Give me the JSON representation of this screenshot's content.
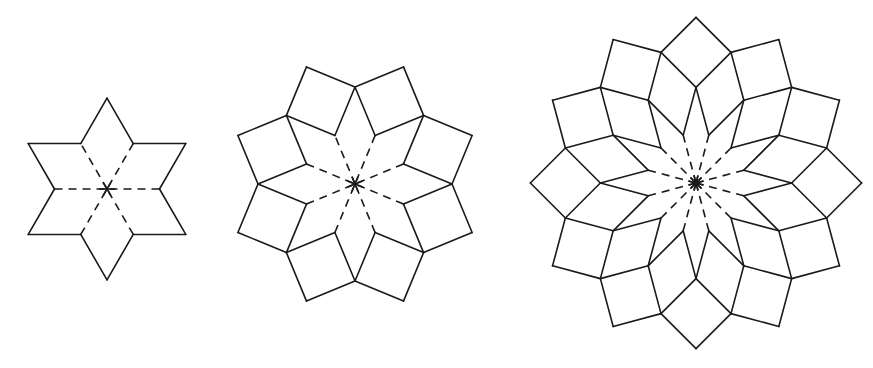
{
  "figures": [
    {
      "name": "six-fold-star",
      "symmetry": 6,
      "layers": 2,
      "side": 52.5,
      "center": [
        107,
        189
      ],
      "rotation_deg": 0
    },
    {
      "name": "eight-fold-rosette",
      "symmetry": 8,
      "layers": 3,
      "side": 52.5,
      "center": [
        355,
        184
      ],
      "rotation_deg": 0
    },
    {
      "name": "twelve-fold-rosette",
      "symmetry": 12,
      "layers": 4,
      "side": 49.5,
      "center": [
        696,
        183
      ],
      "rotation_deg": 0
    }
  ],
  "style": {
    "stroke": "#1a1a1a",
    "background": "#ffffff",
    "center_hub_radius": 8
  }
}
